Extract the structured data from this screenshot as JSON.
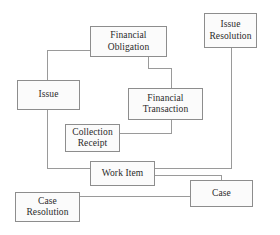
{
  "diagram": {
    "type": "entity-relationship-block-diagram",
    "background_color": "#ffffff",
    "box_fill_color": "#fbfbfb",
    "box_border_color": "#8d8d8d",
    "connector_color": "#9a9a9a",
    "text_color": "#2a2a2a",
    "nodes": [
      {
        "id": "financial-obligation",
        "label": "Financial\nObligation",
        "x": 90,
        "y": 26,
        "w": 77,
        "h": 31
      },
      {
        "id": "issue-resolution",
        "label": "Issue\nResolution",
        "x": 204,
        "y": 13,
        "w": 53,
        "h": 35
      },
      {
        "id": "issue",
        "label": "Issue",
        "x": 17,
        "y": 80,
        "w": 63,
        "h": 30
      },
      {
        "id": "financial-transaction",
        "label": "Financial\nTransaction",
        "x": 128,
        "y": 88,
        "w": 75,
        "h": 32
      },
      {
        "id": "collection-receipt",
        "label": "Collection\nReceipt",
        "x": 65,
        "y": 124,
        "w": 55,
        "h": 28
      },
      {
        "id": "work-item",
        "label": "Work Item",
        "x": 90,
        "y": 161,
        "w": 65,
        "h": 25
      },
      {
        "id": "case",
        "label": "Case",
        "x": 190,
        "y": 180,
        "w": 63,
        "h": 27
      },
      {
        "id": "case-resolution",
        "label": "Case\nResolution",
        "x": 15,
        "y": 192,
        "w": 65,
        "h": 30
      }
    ],
    "connectors": [
      {
        "id": "financial-obligation-to-issue",
        "from": "financial-obligation",
        "to": "issue",
        "path": "M 90 50 L 47 50 L 47 80"
      },
      {
        "id": "financial-obligation-to-financial-transaction",
        "from": "financial-obligation",
        "to": "financial-transaction",
        "path": "M 148 57 L 148 68 L 171 68 L 171 88"
      },
      {
        "id": "issue-to-work-item",
        "from": "issue",
        "to": "work-item",
        "path": "M 47 110 L 47 168 L 90 168"
      },
      {
        "id": "financial-transaction-to-collection-receipt",
        "from": "financial-transaction",
        "to": "collection-receipt",
        "path": "M 171 120 L 171 133 L 120 133"
      },
      {
        "id": "issue-resolution-to-work-item",
        "from": "issue-resolution",
        "to": "work-item",
        "path": "M 231 48 L 231 168 L 155 168"
      },
      {
        "id": "work-item-to-case",
        "from": "work-item",
        "to": "case",
        "path": "M 155 175 L 221 175 L 221 180"
      },
      {
        "id": "case-resolution-to-case",
        "from": "case-resolution",
        "to": "case",
        "path": "M 80 196 L 190 196"
      }
    ]
  }
}
